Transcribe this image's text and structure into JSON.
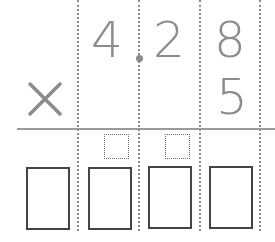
{
  "problem": {
    "operator": "×",
    "multiplicand": {
      "digits": [
        "4",
        "2",
        "8"
      ],
      "decimal_point_after_index": 0
    },
    "multiplier": {
      "digits": [
        "5"
      ]
    }
  },
  "carry_boxes": [
    {
      "column": "ones",
      "value": ""
    },
    {
      "column": "tenths",
      "value": ""
    }
  ],
  "answer_boxes": [
    {
      "value": ""
    },
    {
      "value": ""
    },
    {
      "value": ""
    },
    {
      "value": ""
    }
  ],
  "colors": {
    "digit": "#8c8c8c",
    "rule": "#9a9a9a",
    "box_border": "#444444"
  }
}
